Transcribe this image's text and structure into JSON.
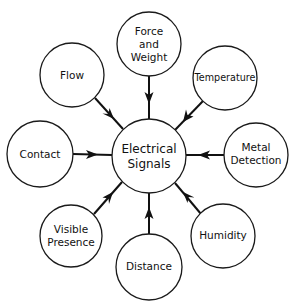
{
  "diagram": {
    "colors": {
      "background": "#ffffff",
      "stroke": "#111111"
    },
    "center": {
      "id": "electrical-signals",
      "lines": [
        "Electrical",
        "Signals"
      ],
      "line1": "Electrical",
      "line2": "Signals"
    },
    "nodes": [
      {
        "id": "force-and-weight",
        "line1": "Force",
        "line2": "and",
        "line3": "Weight",
        "arrow_direction": "toward-center"
      },
      {
        "id": "temperature",
        "line1": "Temperature",
        "arrow_direction": "toward-center"
      },
      {
        "id": "metal-detection",
        "line1": "Metal",
        "line2": "Detection",
        "arrow_direction": "toward-center"
      },
      {
        "id": "humidity",
        "line1": "Humidity",
        "arrow_direction": "toward-center"
      },
      {
        "id": "distance",
        "line1": "Distance",
        "arrow_direction": "toward-center"
      },
      {
        "id": "visible-presence",
        "line1": "Visible",
        "line2": "Presence",
        "arrow_direction": "toward-center"
      },
      {
        "id": "contact",
        "line1": "Contact",
        "arrow_direction": "toward-center"
      },
      {
        "id": "flow",
        "line1": "Flow",
        "arrow_direction": "toward-center"
      }
    ]
  }
}
